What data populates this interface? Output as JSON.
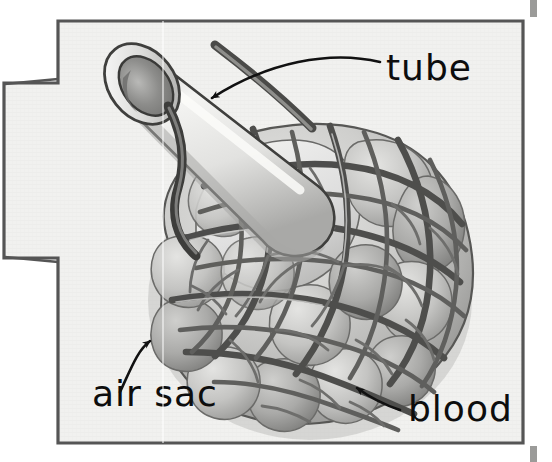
{
  "figure": {
    "kind": "labeled-biology-illustration",
    "medium": "grayscale pencil / ink textbook drawing on paper",
    "frame": {
      "border_color": "#555555",
      "paper_color": "#f0f0ef",
      "outside_color": "#ffffff",
      "left_notch": "rectangular tab protruding from the left edge of the frame"
    },
    "labels": [
      {
        "id": "tube",
        "text": "tube",
        "x": 386,
        "y": 78,
        "anchor": "start"
      },
      {
        "id": "air_sac",
        "text": "air sac",
        "x": 92,
        "y": 404,
        "anchor": "start"
      },
      {
        "id": "blood",
        "text": "blood",
        "x": 408,
        "y": 419,
        "anchor": "start"
      }
    ],
    "callouts": [
      {
        "id": "tube-arrow",
        "from": "tube label",
        "to": "tube wall",
        "points_to_x": 205,
        "points_to_y": 101
      },
      {
        "id": "air-sac-arrow",
        "from": "air sac label",
        "to": "outer sac surface",
        "points_to_x": 152,
        "points_to_y": 338
      },
      {
        "id": "blood-arrow",
        "from": "blood label",
        "to": "capillary vessel",
        "points_to_x": 352,
        "points_to_y": 387
      }
    ],
    "artifacts": {
      "scan_line_x": 163,
      "edge_mark_top_right": true,
      "edge_mark_bottom_right": true
    },
    "colors": {
      "ink_dark": "#2b2b2b",
      "vessel_gray": "#6f6f6f",
      "vessel_dark": "#4a4a4a",
      "sac_fill_light": "#d8d8d6",
      "sac_fill_mid": "#bdbdbb",
      "sac_fill_shadow": "#9a9a98",
      "tube_highlight": "#f2f2f0",
      "tube_shade": "#b8b8b6",
      "tube_bore": "#8e8e8c"
    }
  }
}
